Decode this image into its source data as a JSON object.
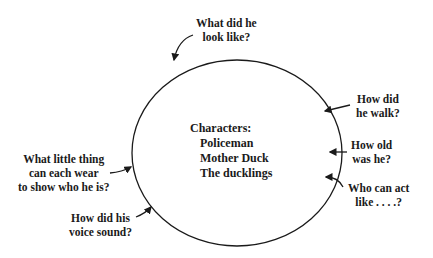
{
  "center": {
    "heading": "Characters:",
    "items": [
      "Policeman",
      "Mother Duck",
      "The ducklings"
    ]
  },
  "prompts": {
    "look": "What did he\nlook like?",
    "walk": "How did\nhe walk?",
    "age": "How old\nwas he?",
    "act": "Who can act\nlike . . . .?",
    "wear": "What little thing\ncan each wear\nto show who he is?",
    "voice": "How did his\nvoice sound?"
  },
  "colors": {
    "ink": "#1a1a1a",
    "background": "#ffffff"
  }
}
